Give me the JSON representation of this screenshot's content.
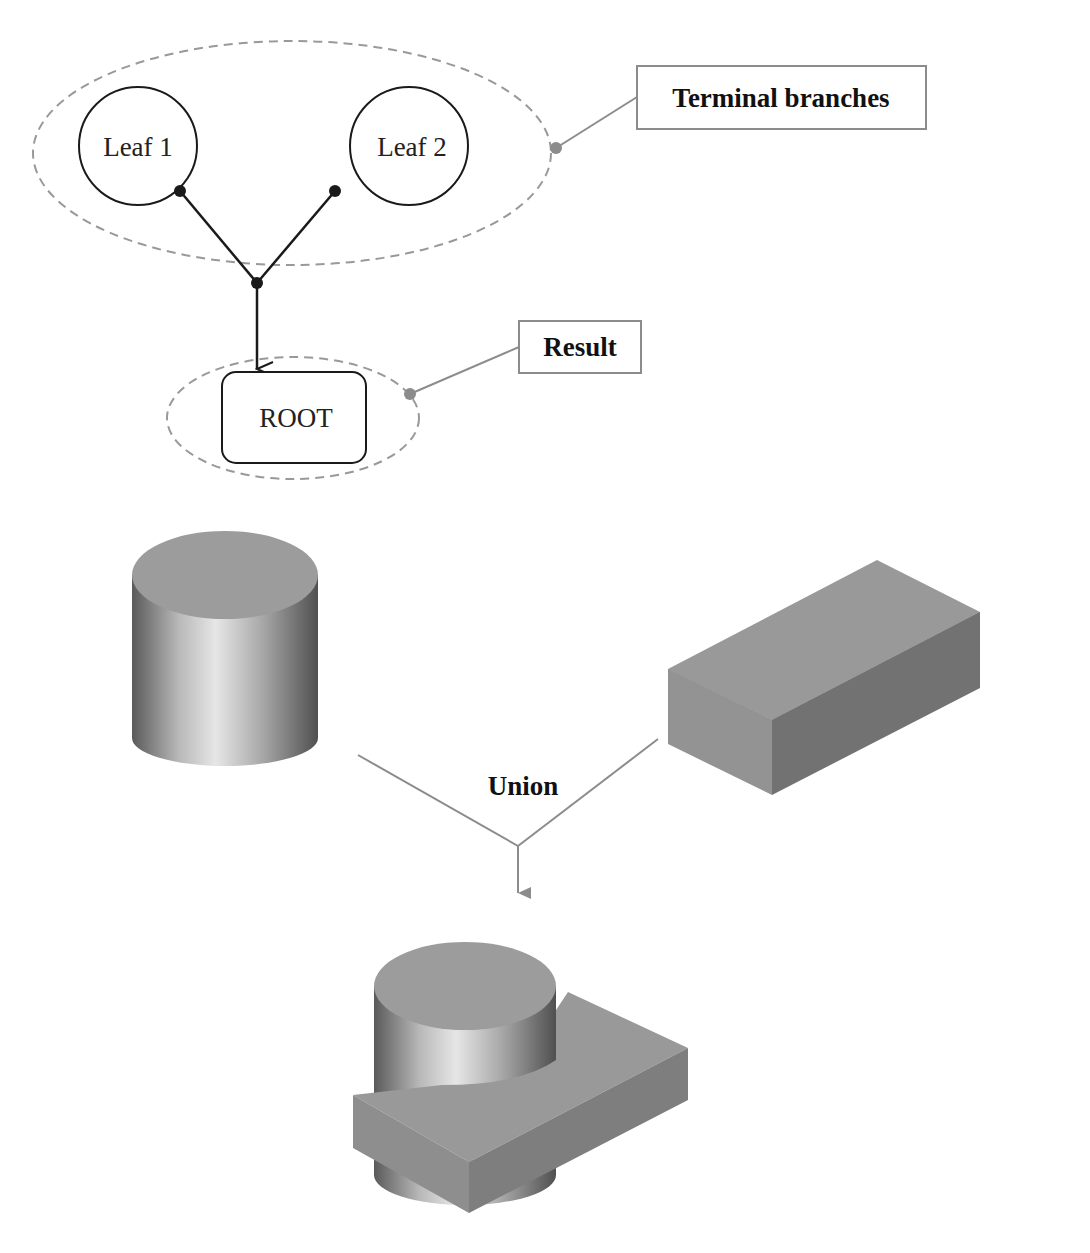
{
  "tree_diagram": {
    "leaves": [
      {
        "label": "Leaf 1"
      },
      {
        "label": "Leaf 2"
      }
    ],
    "root": {
      "label": "ROOT"
    },
    "callouts": {
      "terminal_branches": "Terminal branches",
      "result": "Result"
    }
  },
  "csg_illustration": {
    "operation_label": "Union",
    "operands": [
      "cylinder",
      "box"
    ],
    "result": "cylinder-box-union"
  },
  "colors": {
    "line_dark": "#1a1a1a",
    "line_gray": "#8c8c8c",
    "dashed_ellipse": "#999999",
    "shape_face": "#9a9a9a",
    "shape_side_dark": "#6f6f6f"
  }
}
